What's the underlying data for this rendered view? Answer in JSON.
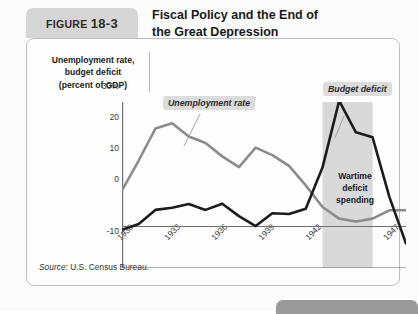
{
  "figure": {
    "tab_prefix": "FIGURE",
    "tab_number": "18-3",
    "source_label": "Source:",
    "source_text": " U.S. Census Bureau."
  },
  "chart_data": {
    "type": "line",
    "xlabel": "Year",
    "ylabel": "Unemployment rate,\nbudget deficit\n(percent of GDP)",
    "xlim": [
      1930,
      1947
    ],
    "ylim": [
      -10,
      30
    ],
    "y_ticks": [
      "30%",
      "20",
      "10",
      "0",
      "-10"
    ],
    "y_tick_values": [
      30,
      20,
      10,
      0,
      -10
    ],
    "x_ticks": [
      "1930",
      "1933",
      "1936",
      "1939",
      "1942",
      "1945",
      "1947"
    ],
    "x_tick_values": [
      1930,
      1933,
      1936,
      1939,
      1942,
      1945,
      1947
    ],
    "grid": false,
    "legend_position": "inline-labels",
    "x": [
      1930,
      1931,
      1932,
      1933,
      1934,
      1935,
      1936,
      1937,
      1938,
      1939,
      1940,
      1941,
      1942,
      1943,
      1944,
      1945,
      1946,
      1947
    ],
    "series": [
      {
        "name": "Unemployment rate",
        "color": "#8c8c8c",
        "values": [
          8.7,
          15.9,
          23.6,
          24.9,
          21.7,
          20.1,
          16.9,
          14.3,
          19.0,
          17.2,
          14.6,
          9.9,
          4.7,
          1.9,
          1.2,
          1.9,
          3.9,
          3.9
        ]
      },
      {
        "name": "Budget deficit",
        "color": "#1c1c1c",
        "values": [
          -0.8,
          0.6,
          4.0,
          4.5,
          5.4,
          4.0,
          5.5,
          2.5,
          0.1,
          3.2,
          3.0,
          4.3,
          14.2,
          30.3,
          22.7,
          21.5,
          7.2,
          -4.1
        ]
      }
    ],
    "annotations": [
      {
        "text": "Unemployment rate",
        "type": "series-label"
      },
      {
        "text": "Budget deficit",
        "type": "series-label"
      },
      {
        "text": "Wartime\ndeficit\nspending",
        "type": "callout"
      }
    ],
    "shaded_band": {
      "label": "Wartime deficit spending",
      "x_start": 1942,
      "x_end": 1945,
      "color": "#d9d9d9"
    }
  },
  "annotations": {
    "unemployment_tag": "Unemployment rate",
    "deficit_tag": "Budget deficit",
    "wartime_line1": "Wartime",
    "wartime_line2": "deficit",
    "wartime_line3": "spending"
  },
  "axes": {
    "y_label_line1": "Unemployment rate,",
    "y_label_line2": "budget deficit",
    "y_label_line3": "(percent of GDP)",
    "x_title": "Year"
  },
  "colors": {
    "unemployment": "#8c8c8c",
    "deficit": "#1c1c1c",
    "band": "#d9d9d9",
    "tab": "#d6d6d6",
    "panel_border": "#bfbfbf"
  }
}
